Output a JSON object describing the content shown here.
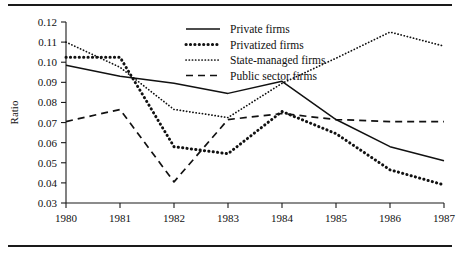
{
  "figure": {
    "type": "line-chart-figure",
    "top_rule": "horizontal-rule",
    "bottom_rule": "horizontal-rule"
  },
  "chart_data": {
    "type": "line",
    "title": "",
    "xlabel": "",
    "ylabel": "Ratio",
    "x": [
      1980,
      1981,
      1982,
      1983,
      1984,
      1985,
      1986,
      1987
    ],
    "xticklabels": [
      "1980",
      "1981",
      "1982",
      "1983",
      "1984",
      "1985",
      "1986",
      "1987"
    ],
    "yticks": [
      0.03,
      0.04,
      0.05,
      0.06,
      0.07,
      0.08,
      0.09,
      0.1,
      0.11,
      0.12
    ],
    "yticklabels": [
      "0.03",
      "0.04",
      "0.05",
      "0.06",
      "0.07",
      "0.08",
      "0.09",
      "0.10",
      "0.11",
      "0.12"
    ],
    "ylim": [
      0.03,
      0.12
    ],
    "xlim": [
      1980,
      1987
    ],
    "grid": false,
    "legend_position": "top-right",
    "series": [
      {
        "name": "Private firms",
        "style": "solid",
        "color": "#111111",
        "values": [
          0.0985,
          0.093,
          0.0895,
          0.0845,
          0.0905,
          0.0715,
          0.058,
          0.051
        ]
      },
      {
        "name": "Privatized firms",
        "style": "thick-dotted",
        "color": "#111111",
        "values": [
          0.1025,
          0.1025,
          0.058,
          0.0545,
          0.0755,
          0.0645,
          0.0465,
          0.039
        ]
      },
      {
        "name": "State-managed firms",
        "style": "fine-dotted",
        "color": "#111111",
        "values": [
          0.11,
          0.0975,
          0.0765,
          0.0725,
          0.0895,
          0.102,
          0.115,
          0.108
        ]
      },
      {
        "name": "Public sector firms",
        "style": "dashed",
        "color": "#111111",
        "values": [
          0.0705,
          0.0765,
          0.0405,
          0.0715,
          0.0745,
          0.0715,
          0.0705,
          0.0705
        ]
      }
    ]
  }
}
